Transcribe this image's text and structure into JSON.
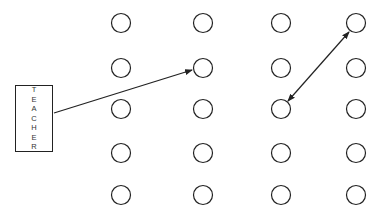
{
  "diagram": {
    "teacher_label": "TEACHER",
    "grid": {
      "rows": 5,
      "cols": 4
    },
    "arrows": [
      {
        "from": "teacher",
        "to": {
          "row": 2,
          "col": 2
        },
        "style": "single-headed"
      },
      {
        "from": {
          "row": 1,
          "col": 4
        },
        "to": {
          "row": 3,
          "col": 3
        },
        "style": "double-headed"
      }
    ],
    "colors": {
      "stroke": "#222222",
      "background": "#ffffff"
    }
  }
}
